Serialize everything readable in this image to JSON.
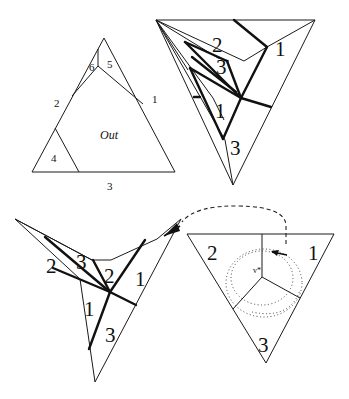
{
  "figures": {
    "fig_a": {
      "description": "Triangle partitioned into regions",
      "labels": {
        "l1": "1",
        "l2": "2",
        "l3": "3",
        "l4": "4",
        "l5": "5",
        "l6": "6",
        "out": "Out"
      }
    },
    "fig_b": {
      "description": "Inverted triangle with thick-line subdivision",
      "labels": {
        "l1a": "1",
        "l2": "2",
        "l3a": "3",
        "l1b": "1",
        "l3b": "3"
      }
    },
    "fig_c": {
      "description": "Folded star-shaped polygon with thick-line subdivision",
      "labels": {
        "l2a": "2",
        "l3a": "3",
        "l2b": "2",
        "l1a": "1",
        "l1b": "1",
        "l3b": "3"
      }
    },
    "fig_d": {
      "description": "Inverted triangle with three regions around vertex v*",
      "labels": {
        "l1": "1",
        "l2": "2",
        "l3": "3",
        "vertex": "v*"
      }
    }
  }
}
